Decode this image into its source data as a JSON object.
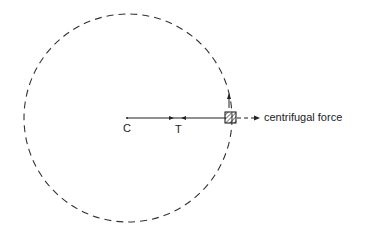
{
  "diagram": {
    "type": "circular-motion-force-diagram",
    "labels": {
      "center": "C",
      "tension": "T",
      "force": "centrifugal force"
    },
    "elements": {
      "orbit": "dashed circular path",
      "mass": "hatched square on circle",
      "string": "line from C to mass",
      "tension_arrows": "arrows pointing toward each other at T",
      "velocity_arrow": "upward arrow tangent at mass",
      "force_arrow": "dashed arrow pointing outward from mass"
    },
    "colors": {
      "ink": "#222222",
      "background": "#ffffff"
    }
  }
}
